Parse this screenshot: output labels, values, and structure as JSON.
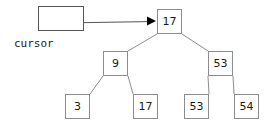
{
  "diagram": {
    "stroke_color": "#8c8c8c",
    "edge_color": "#8c8c8c",
    "pointer_color": "#555555",
    "arrowhead_color": "#000000",
    "text_color": "#1a1a1a",
    "background": "#ffffff"
  },
  "cursor": {
    "label": "cursor",
    "box_value": "",
    "box": {
      "x": 38,
      "y": 6,
      "w": 46,
      "h": 25
    },
    "label_pos": {
      "x": 14,
      "y": 38
    },
    "pointer_from": {
      "x": 62,
      "y": 23
    },
    "pointer_to": {
      "x": 156,
      "y": 21
    }
  },
  "tree": {
    "nodes": [
      {
        "id": "root",
        "value": "17",
        "x": 157,
        "y": 9,
        "w": 25,
        "h": 25,
        "level": 0
      },
      {
        "id": "n9",
        "value": "9",
        "x": 103,
        "y": 51,
        "w": 25,
        "h": 25,
        "level": 1
      },
      {
        "id": "n53",
        "value": "53",
        "x": 208,
        "y": 51,
        "w": 25,
        "h": 25,
        "level": 1
      },
      {
        "id": "l3",
        "value": "3",
        "x": 65,
        "y": 94,
        "w": 25,
        "h": 25,
        "level": 2
      },
      {
        "id": "l17",
        "value": "17",
        "x": 133,
        "y": 94,
        "w": 25,
        "h": 25,
        "level": 2
      },
      {
        "id": "l53",
        "value": "53",
        "x": 184,
        "y": 94,
        "w": 25,
        "h": 25,
        "level": 2
      },
      {
        "id": "l54",
        "value": "54",
        "x": 234,
        "y": 94,
        "w": 25,
        "h": 25,
        "level": 2
      }
    ],
    "edges": [
      {
        "from": "root",
        "to": "n9",
        "x1": 157,
        "y1": 34,
        "x2": 128,
        "y2": 51
      },
      {
        "from": "root",
        "to": "n53",
        "x1": 182,
        "y1": 34,
        "x2": 208,
        "y2": 51
      },
      {
        "from": "n9",
        "to": "l3",
        "x1": 103,
        "y1": 76,
        "x2": 90,
        "y2": 94
      },
      {
        "from": "n9",
        "to": "l17",
        "x1": 128,
        "y1": 76,
        "x2": 133,
        "y2": 94
      },
      {
        "from": "n53",
        "to": "l53",
        "x1": 208,
        "y1": 76,
        "x2": 209,
        "y2": 94
      },
      {
        "from": "n53",
        "to": "l54",
        "x1": 233,
        "y1": 76,
        "x2": 234,
        "y2": 94
      }
    ]
  }
}
